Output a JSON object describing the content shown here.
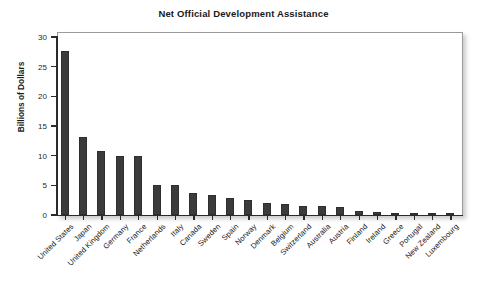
{
  "chart_data": {
    "type": "bar",
    "title": "Net Official Development Assistance",
    "xlabel": "",
    "ylabel": "Billions of Dollars",
    "ylim": [
      0,
      30
    ],
    "yticks": [
      0,
      5,
      10,
      15,
      20,
      25,
      30
    ],
    "ytick_labels": [
      "0",
      "5",
      "10",
      "15",
      "20",
      "25",
      "30"
    ],
    "grid": false,
    "legend": "none",
    "bar_color": "#3b3b3b",
    "categories": [
      "United States",
      "Japan",
      "United Kingdom",
      "Germany",
      "France",
      "Netherlands",
      "Italy",
      "Canada",
      "Sweden",
      "Spain",
      "Norway",
      "Denmark",
      "Belgium",
      "Switzerland",
      "Australia",
      "Austria",
      "Finland",
      "Ireland",
      "Greece",
      "Portugal",
      "New Zealand",
      "Luxembourg"
    ],
    "values": [
      27.6,
      13.1,
      10.8,
      10.0,
      10.0,
      5.1,
      5.0,
      3.7,
      3.3,
      2.9,
      2.6,
      2.0,
      1.9,
      1.6,
      1.5,
      1.4,
      0.7,
      0.5,
      0.25,
      0.25,
      0.12,
      0.1
    ]
  }
}
